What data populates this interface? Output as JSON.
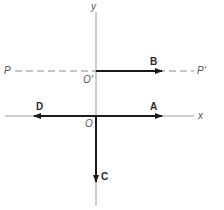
{
  "diagram": {
    "axes": {
      "x_label": "x",
      "y_label": "y",
      "origin_label": "O"
    },
    "reference_line": {
      "start_label": "P",
      "end_label": "P'",
      "origin_label": "O'",
      "style": "dashed"
    },
    "vectors": [
      {
        "label": "A",
        "from": "O",
        "direction": "+x"
      },
      {
        "label": "B",
        "from": "O'",
        "direction": "+x"
      },
      {
        "label": "C",
        "from": "O",
        "direction": "-y"
      },
      {
        "label": "D",
        "from": "O",
        "direction": "-x"
      }
    ],
    "colors": {
      "axis": "#9a9a9a",
      "vector": "#1a1a1a",
      "dashed": "#8a8a8a",
      "label": "#444444"
    }
  }
}
